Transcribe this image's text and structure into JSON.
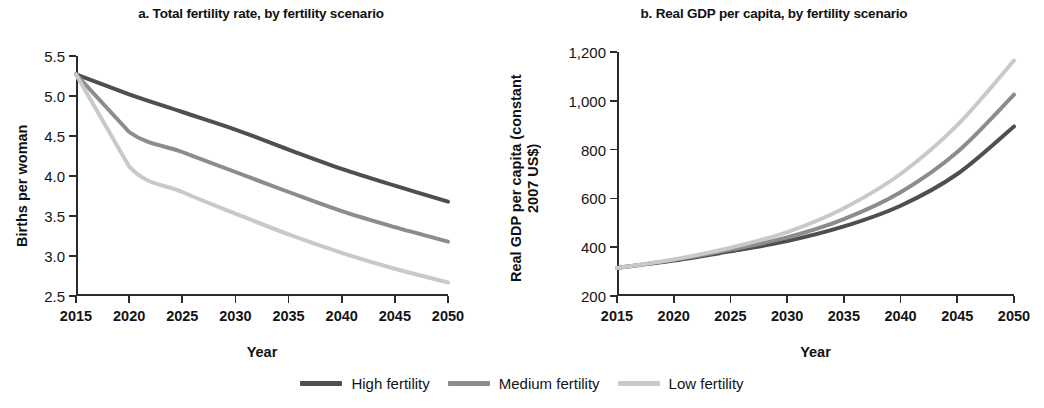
{
  "figure": {
    "legend": {
      "items": [
        {
          "label": "High fertility",
          "color": "#4f4f4f"
        },
        {
          "label": "Medium fertility",
          "color": "#8c8c8c"
        },
        {
          "label": "Low fertility",
          "color": "#c9c9c9"
        }
      ]
    }
  },
  "chart_data": [
    {
      "id": "a",
      "type": "line",
      "title": "a. Total fertility rate, by fertility scenario",
      "xlabel": "Year",
      "ylabel": "Births per woman",
      "x": [
        2015,
        2020,
        2025,
        2030,
        2035,
        2040,
        2045,
        2050
      ],
      "xlim": [
        2015,
        2050
      ],
      "ylim": [
        2.5,
        5.5
      ],
      "xticks": [
        "2015",
        "2020",
        "2025",
        "2030",
        "2035",
        "2040",
        "2045",
        "2050"
      ],
      "yticks": [
        "5.5",
        "5.0",
        "4.5",
        "4.0",
        "3.5",
        "3.0",
        "2.5"
      ],
      "grid": false,
      "legend_position": "bottom",
      "series": [
        {
          "name": "High fertility",
          "color": "#4f4f4f",
          "values": [
            5.27,
            5.02,
            4.8,
            4.58,
            4.33,
            4.09,
            3.88,
            3.68
          ]
        },
        {
          "name": "Medium fertility",
          "color": "#8c8c8c",
          "values": [
            5.27,
            4.55,
            4.3,
            4.05,
            3.8,
            3.56,
            3.36,
            3.18
          ]
        },
        {
          "name": "Low fertility",
          "color": "#c9c9c9",
          "values": [
            5.27,
            4.12,
            3.8,
            3.53,
            3.27,
            3.04,
            2.84,
            2.67
          ]
        }
      ]
    },
    {
      "id": "b",
      "type": "line",
      "title": "b. Real GDP per capita, by fertility scenario",
      "xlabel": "Year",
      "ylabel": "Real GDP per capita (constant 2007 US$)",
      "x": [
        2015,
        2020,
        2025,
        2030,
        2035,
        2040,
        2045,
        2050
      ],
      "xlim": [
        2015,
        2050
      ],
      "ylim": [
        200,
        1200
      ],
      "xticks": [
        "2015",
        "2020",
        "2025",
        "2030",
        "2035",
        "2040",
        "2045",
        "2050"
      ],
      "yticks": [
        "1,200",
        "1,000",
        "800",
        "600",
        "400",
        "200"
      ],
      "grid": false,
      "legend_position": "bottom",
      "series": [
        {
          "name": "High fertility",
          "color": "#4f4f4f",
          "values": [
            315,
            345,
            383,
            425,
            485,
            570,
            700,
            895
          ]
        },
        {
          "name": "Medium fertility",
          "color": "#8c8c8c",
          "values": [
            315,
            348,
            390,
            440,
            515,
            625,
            790,
            1025
          ]
        },
        {
          "name": "Low fertility",
          "color": "#c9c9c9",
          "values": [
            315,
            350,
            398,
            462,
            560,
            700,
            900,
            1165
          ]
        }
      ]
    }
  ]
}
